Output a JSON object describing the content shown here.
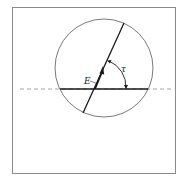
{
  "diagram": {
    "labels": {
      "vector": "E",
      "angle": "τ"
    },
    "colors": {
      "frame": "#8a8a8a",
      "circle": "#6a6a6a",
      "line": "#1a1a1a",
      "dashed": "#9a9a9a",
      "background": "#ffffff"
    },
    "elements": [
      "frame",
      "circle",
      "horizontal-dashed-axis",
      "horizontal-solid-chord",
      "tilted-diameter-line",
      "E-vector-arrow",
      "tau-angle-arc"
    ]
  }
}
